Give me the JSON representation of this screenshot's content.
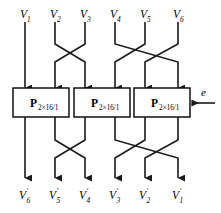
{
  "figure": {
    "line_color": "#1a1a1a",
    "box_fill": "#ffffff",
    "box_stroke": "#111111",
    "background": "#ffffff"
  },
  "inputs": [
    {
      "name": "input-v1",
      "base": "V",
      "sub": "1",
      "x": 25
    },
    {
      "name": "input-v2",
      "base": "V",
      "sub": "2",
      "x": 55
    },
    {
      "name": "input-v3",
      "base": "V",
      "sub": "3",
      "x": 85
    },
    {
      "name": "input-v4",
      "base": "V",
      "sub": "4",
      "x": 115
    },
    {
      "name": "input-v5",
      "base": "V",
      "sub": "5",
      "x": 145
    },
    {
      "name": "input-v6",
      "base": "V",
      "sub": "6",
      "x": 178
    }
  ],
  "outputs": [
    {
      "name": "output-v6-prime",
      "base": "V",
      "prime": "′",
      "sub": "6",
      "x": 25
    },
    {
      "name": "output-v5-prime",
      "base": "V",
      "prime": "′",
      "sub": "5",
      "x": 55
    },
    {
      "name": "output-v4-prime",
      "base": "V",
      "prime": "′",
      "sub": "4",
      "x": 85
    },
    {
      "name": "output-v3-prime",
      "base": "V",
      "prime": "′",
      "sub": "3",
      "x": 115
    },
    {
      "name": "output-v2-prime",
      "base": "V",
      "prime": "′",
      "sub": "2",
      "x": 145
    },
    {
      "name": "output-v1-prime",
      "base": "V",
      "prime": "′",
      "sub": "1",
      "x": 178
    }
  ],
  "blocks": [
    {
      "name": "block-p-left",
      "main": "P",
      "sub": "2×16/1",
      "x": 13,
      "y": 88,
      "w": 56,
      "h": 29
    },
    {
      "name": "block-p-middle",
      "main": "P",
      "sub": "2×16/1",
      "x": 74,
      "y": 88,
      "w": 56,
      "h": 29
    },
    {
      "name": "block-p-right",
      "main": "P",
      "sub": "2×16/1",
      "x": 134,
      "y": 88,
      "w": 56,
      "h": 29
    }
  ],
  "enable": {
    "label": "e",
    "name": "enable-signal",
    "arrow_from_x": 215,
    "arrow_to_x": 192,
    "y": 103
  },
  "geometry": {
    "top_label_y": 18,
    "top_wire_start_y": 22,
    "top_bus_y": 44,
    "top_cross_y": 62,
    "box_top_y": 88,
    "box_bottom_y": 117,
    "bottom_bus_y": 140,
    "bottom_cross_y": 158,
    "bottom_arrow_y": 178,
    "bottom_label_y": 199
  },
  "wiring": {
    "description": "Upper stage routes inputs V1..V6 to the three P blocks; lower stage routes block outputs to V'6..V'1 in reversed order.",
    "upper_paths": [
      {
        "name": "wire-v1-to-left-block",
        "from": 25,
        "to": 25
      },
      {
        "name": "wire-v2-to-block-port",
        "from": 55,
        "to": 85
      },
      {
        "name": "wire-v3-to-block-port",
        "from": 85,
        "to": 55
      },
      {
        "name": "wire-v4-to-block-port",
        "from": 115,
        "to": 178
      },
      {
        "name": "wire-v5-to-block-port",
        "from": 145,
        "to": 115
      },
      {
        "name": "wire-v6-to-block-port",
        "from": 178,
        "to": 145
      }
    ],
    "lower_paths": [
      {
        "name": "wire-out-left-1",
        "from": 25,
        "to": 25
      },
      {
        "name": "wire-out-left-2",
        "from": 55,
        "to": 85
      },
      {
        "name": "wire-out-mid-1",
        "from": 85,
        "to": 55
      },
      {
        "name": "wire-out-mid-2",
        "from": 115,
        "to": 178
      },
      {
        "name": "wire-out-right-1",
        "from": 145,
        "to": 115
      },
      {
        "name": "wire-out-right-2",
        "from": 178,
        "to": 145
      }
    ]
  }
}
